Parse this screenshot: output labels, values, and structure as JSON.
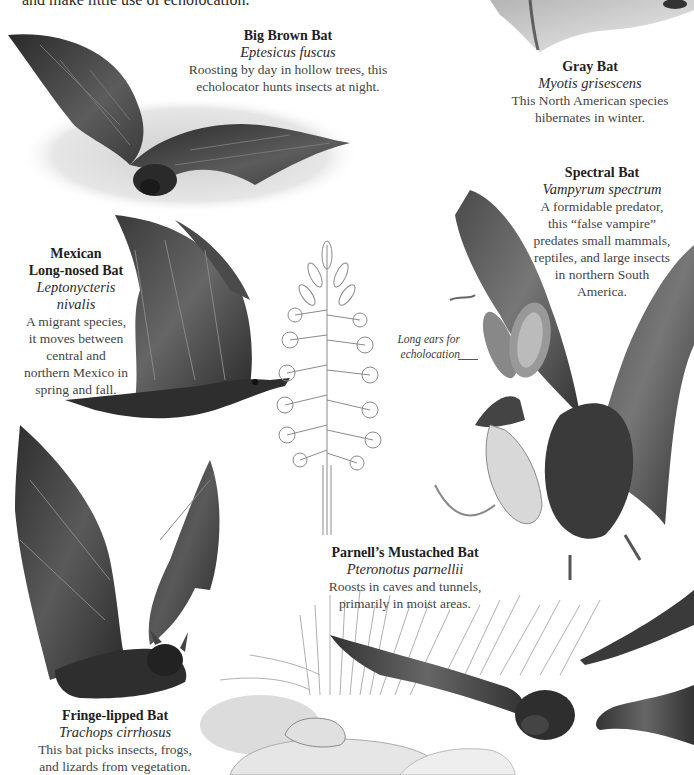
{
  "intro_text": "and make little use of echolocation.",
  "species": [
    {
      "id": "big-brown-bat",
      "common_name": "Big Brown Bat",
      "scientific_name": "Eptesicus fuscus",
      "description_lines": [
        "Roosting by day in hollow trees, this",
        "echolocator hunts insects at night."
      ]
    },
    {
      "id": "gray-bat",
      "common_name": "Gray Bat",
      "scientific_name": "Myotis grisescens",
      "description_lines": [
        "This North American species",
        "hibernates in winter."
      ]
    },
    {
      "id": "spectral-bat",
      "common_name": "Spectral Bat",
      "scientific_name": "Vampyrum spectrum",
      "description_lines": [
        "A formidable predator,",
        "this “false vampire”",
        "predates small mammals,",
        "reptiles, and large insects",
        "in northern South",
        "America."
      ]
    },
    {
      "id": "mexican-long-nosed-bat",
      "common_name_lines": [
        "Mexican",
        "Long-nosed Bat"
      ],
      "scientific_name_lines": [
        "Leptonycteris",
        "nivalis"
      ],
      "description_lines": [
        "A migrant species,",
        "it moves between",
        "central and",
        "northern Mexico in",
        "spring and fall."
      ]
    },
    {
      "id": "parnells-mustached-bat",
      "common_name": "Parnell’s Mustached Bat",
      "scientific_name": "Pteronotus parnellii",
      "description_lines": [
        "Roosts in caves and tunnels,",
        "primarily in moist areas."
      ]
    },
    {
      "id": "fringe-lipped-bat",
      "common_name": "Fringe-lipped Bat",
      "scientific_name": "Trachops cirrhosus",
      "description_lines": [
        "This bat picks insects, frogs,",
        "and lizards from vegetation."
      ]
    }
  ],
  "annotation": {
    "lines": [
      "Long ears for",
      "echolocation"
    ]
  },
  "colors": {
    "ink": "#1e1e1e",
    "wing_dark": "#3a3a3a",
    "wing_mid": "#5a5a5a",
    "body_fur": "#2e2e2e",
    "sketch": "#9a9a9a",
    "background": "#ffffff"
  }
}
